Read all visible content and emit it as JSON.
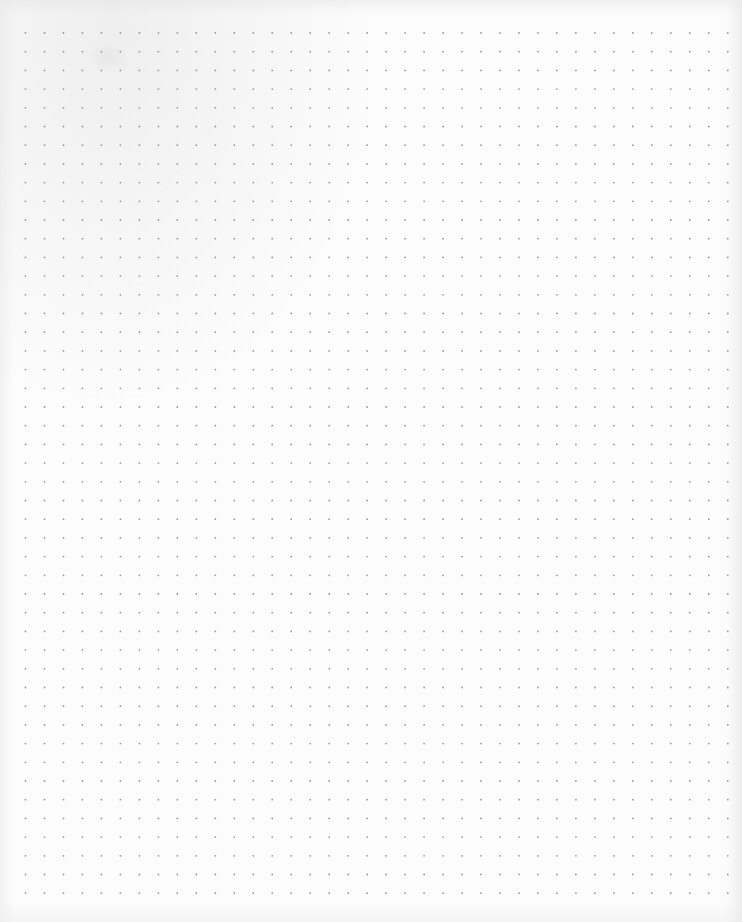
{
  "page": {
    "type": "dot-grid paper",
    "paper_color": "#fcfcfc",
    "dot_color": "#9a9a9a",
    "grid": {
      "columns": 38,
      "rows": 47
    }
  }
}
